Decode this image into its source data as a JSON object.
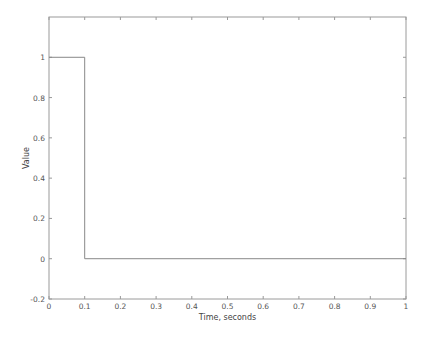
{
  "chart_data": {
    "type": "line",
    "title": "",
    "xlabel": "Time, seconds",
    "ylabel": "Value",
    "xlim": [
      0,
      1
    ],
    "ylim": [
      -0.2,
      1.2
    ],
    "xticks": [
      0,
      0.1,
      0.2,
      0.3,
      0.4,
      0.5,
      0.6,
      0.7,
      0.8,
      0.9,
      1
    ],
    "xtick_labels": [
      "0",
      "0.1",
      "0.2",
      "0.3",
      "0.4",
      "0.5",
      "0.6",
      "0.7",
      "0.8",
      "0.9",
      "1"
    ],
    "yticks": [
      -0.2,
      0,
      0.2,
      0.4,
      0.6,
      0.8,
      1
    ],
    "ytick_labels": [
      "-0.2",
      "0",
      "0.2",
      "0.4",
      "0.6",
      "0.8",
      "1"
    ],
    "grid": false,
    "legend": null,
    "series": [
      {
        "name": "pulse",
        "x": [
          0,
          0.1,
          0.1,
          1
        ],
        "y": [
          1,
          1,
          0,
          0
        ],
        "color": "#888888"
      }
    ]
  },
  "style": {
    "axis_color": "#999999",
    "line_color": "#888888"
  }
}
